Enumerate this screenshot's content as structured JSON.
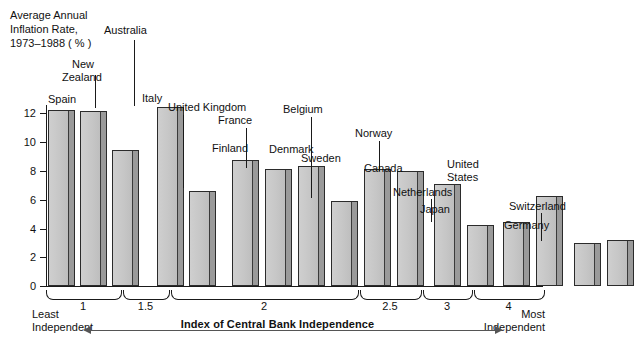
{
  "chart_data": {
    "type": "bar",
    "title": "",
    "ylabel": "Average Annual Inflation Rate, 1973–1988 (%)",
    "xlabel": "Index of Central Bank Independence",
    "ylim": [
      0,
      13
    ],
    "yticks": [
      0,
      2,
      4,
      6,
      8,
      10,
      12
    ],
    "ytick_labels": [
      "0",
      "2",
      "4",
      "6",
      "8",
      "10",
      "12"
    ],
    "grid": false,
    "legend": null,
    "xtick_labels": [
      "1",
      "1.5",
      "2",
      "2.5",
      "3",
      "4"
    ],
    "x_axis_note_left": "Least Independent",
    "x_axis_note_right": "Most Independent",
    "categories": [
      "Spain",
      "New Zealand",
      "Australia",
      "Italy",
      "United Kingdom",
      "Finland",
      "France",
      "Denmark",
      "Belgium",
      "Sweden",
      "Norway",
      "Canada",
      "Netherlands",
      "Japan",
      "United States",
      "Switzerland",
      "Germany"
    ],
    "values": [
      12.2,
      12.1,
      9.4,
      12.4,
      6.6,
      8.7,
      8.1,
      8.3,
      5.9,
      8.1,
      8.0,
      7.1,
      4.2,
      4.4,
      6.2,
      3.0,
      3.2
    ],
    "index_values": [
      1,
      1,
      1,
      1.5,
      1.5,
      2,
      2,
      2,
      2,
      2,
      2,
      2.5,
      2.5,
      3,
      3,
      4,
      4
    ]
  },
  "y_axis": {
    "title_line1": "Average Annual",
    "title_line2": "Inflation Rate,",
    "title_line3": "1973–1988 ( % )",
    "ticks": [
      "12",
      "10",
      "8",
      "6",
      "4",
      "2",
      "0"
    ]
  },
  "x_axis": {
    "title": "Index of Central Bank Independence",
    "least_line1": "Least",
    "least_line2": "Independent",
    "most_line1": "Most",
    "most_line2": "Independent",
    "groups": [
      {
        "label": "1"
      },
      {
        "label": "1.5"
      },
      {
        "label": "2"
      },
      {
        "label": "2.5"
      },
      {
        "label": "3"
      },
      {
        "label": "4"
      }
    ]
  },
  "bars": [
    {
      "name": "Spain",
      "value": 12.2,
      "label": "Spain"
    },
    {
      "name": "New Zealand",
      "value": 12.1,
      "label_line1": "New",
      "label_line2": "Zealand"
    },
    {
      "name": "Australia",
      "value": 9.4,
      "label": "Australia"
    },
    {
      "name": "Italy",
      "value": 12.4,
      "label": "Italy"
    },
    {
      "name": "United Kingdom",
      "value": 6.6,
      "label": "United Kingdom"
    },
    {
      "name": "Finland",
      "value": 8.7,
      "label": "Finland"
    },
    {
      "name": "France",
      "value": 8.1,
      "label": "France"
    },
    {
      "name": "Denmark",
      "value": 8.3,
      "label": "Denmark"
    },
    {
      "name": "Belgium",
      "value": 5.9,
      "label": "Belgium"
    },
    {
      "name": "Sweden",
      "value": 8.1,
      "label": "Sweden"
    },
    {
      "name": "Norway",
      "value": 8.0,
      "label": "Norway"
    },
    {
      "name": "Canada",
      "value": 7.1,
      "label": "Canada"
    },
    {
      "name": "Netherlands",
      "value": 4.2,
      "label": "Netherlands"
    },
    {
      "name": "Japan",
      "value": 4.4,
      "label": "Japan"
    },
    {
      "name": "United States",
      "value": 6.2,
      "label_line1": "United",
      "label_line2": "States"
    },
    {
      "name": "Switzerland",
      "value": 3.0,
      "label": "Switzerland"
    },
    {
      "name": "Germany",
      "value": 3.2,
      "label": "Germany"
    }
  ]
}
